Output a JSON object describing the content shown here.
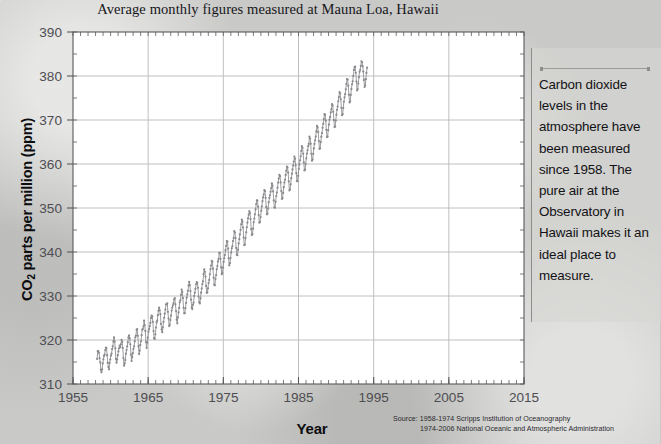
{
  "chart_data": {
    "type": "line",
    "title": "Average monthly figures measured at Mauna Loa, Hawaii",
    "xlabel": "Year",
    "ylabel_html": "CO<sub>2</sub> parts per million (ppm)",
    "ylabel_text": "CO2 parts per million (ppm)",
    "xlim": [
      1955,
      2015
    ],
    "ylim": [
      310,
      390
    ],
    "x_major_ticks": [
      1955,
      1965,
      1975,
      1985,
      1995,
      2005,
      2015
    ],
    "x_minor_step": 1,
    "y_major_ticks": [
      310,
      320,
      330,
      340,
      350,
      360,
      370,
      380,
      390
    ],
    "y_minor_step": 5,
    "grid": "major-both",
    "legend": "none",
    "marker": "circle",
    "series_name": "Monthly mean CO2 concentration",
    "series_color": "#8a8a8e",
    "x_start": 1958.208,
    "x_step": 0.08333,
    "values": [
      315.71,
      317.45,
      317.5,
      317.1,
      315.86,
      314.93,
      313.2,
      312.66,
      313.33,
      314.67,
      315.62,
      316.38,
      316.71,
      317.72,
      318.29,
      318.16,
      316.55,
      314.8,
      313.84,
      313.34,
      314.81,
      315.59,
      316.43,
      316.9,
      317.94,
      318.56,
      319.69,
      320.58,
      319.61,
      318.1,
      315.71,
      314.85,
      315.56,
      316.55,
      317.4,
      318.13,
      318.74,
      318.38,
      319.02,
      320.03,
      319.59,
      318.18,
      315.91,
      314.16,
      314.67,
      315.43,
      316.89,
      317.7,
      318.54,
      319.48,
      320.58,
      321.03,
      320.35,
      319.03,
      316.69,
      315.23,
      316.1,
      317.01,
      317.94,
      318.56,
      319.68,
      320.63,
      321.01,
      322.33,
      322.5,
      320.97,
      318.6,
      316.79,
      317.6,
      318.89,
      319.7,
      321.09,
      322.33,
      322.5,
      323.04,
      324.42,
      323.41,
      322.06,
      319.55,
      318.18,
      319.4,
      320.54,
      321.86,
      322.47,
      323.15,
      323.89,
      325.02,
      325.57,
      325.36,
      324.14,
      322.03,
      320.41,
      320.25,
      321.31,
      322.84,
      324.0,
      324.42,
      325.64,
      326.66,
      327.34,
      326.76,
      325.88,
      323.67,
      322.38,
      321.78,
      322.85,
      324.11,
      325.06,
      325.98,
      326.93,
      328.13,
      328.07,
      328.34,
      326.41,
      324.87,
      323.17,
      323.46,
      324.53,
      325.54,
      326.71,
      327.38,
      327.87,
      328.4,
      329.23,
      329.5,
      328.11,
      326.59,
      324.61,
      323.78,
      325.13,
      326.26,
      327.3,
      328.57,
      329.05,
      330.27,
      331.45,
      330.91,
      329.52,
      327.33,
      326.06,
      326.12,
      327.19,
      328.43,
      329.61,
      330.37,
      331.18,
      332.37,
      333.21,
      332.45,
      331.14,
      329.17,
      327.35,
      327.02,
      327.99,
      328.48,
      330.01,
      330.77,
      331.6,
      332.67,
      333.17,
      332.96,
      331.88,
      329.89,
      328.59,
      328.32,
      329.44,
      330.76,
      331.71,
      332.7,
      333.31,
      334.97,
      336.04,
      335.47,
      334.43,
      332.28,
      330.72,
      330.84,
      331.73,
      332.96,
      333.66,
      334.94,
      336.12,
      336.92,
      337.98,
      337.78,
      336.2,
      334.19,
      332.57,
      332.43,
      333.86,
      334.76,
      336.08,
      336.79,
      337.85,
      338.43,
      339.8,
      339.83,
      338.47,
      336.5,
      334.92,
      335.2,
      336.48,
      337.75,
      338.58,
      339.32,
      340.42,
      341.39,
      342.49,
      342.34,
      340.8,
      338.54,
      336.98,
      337.47,
      338.62,
      339.86,
      340.85,
      341.35,
      342.48,
      343.17,
      344.74,
      344.42,
      343.18,
      340.92,
      339.4,
      339.26,
      340.52,
      341.94,
      342.91,
      343.99,
      345.04,
      346.31,
      347.38,
      346.9,
      345.57,
      343.28,
      341.54,
      341.71,
      343.12,
      344.47,
      345.62,
      346.66,
      347.65,
      348.48,
      349.31,
      348.89,
      347.5,
      345.21,
      343.84,
      344.07,
      345.3,
      346.76,
      347.61,
      348.56,
      349.69,
      350.9,
      351.74,
      351.7,
      350.31,
      348.4,
      346.67,
      346.85,
      347.94,
      349.4,
      350.39,
      351.54,
      352.4,
      353.05,
      354.09,
      353.83,
      352.32,
      350.25,
      348.56,
      348.73,
      349.89,
      351.33,
      352.31,
      352.9,
      353.71,
      354.53,
      355.58,
      355.07,
      353.79,
      351.73,
      350.15,
      350.08,
      351.41,
      352.73,
      353.51,
      354.61,
      355.78,
      356.7,
      357.54,
      357.23,
      355.81,
      353.86,
      352.05,
      352.26,
      353.42,
      354.74,
      355.77,
      356.42,
      357.52,
      358.51,
      359.42,
      359.2,
      358.06,
      356.06,
      354.0,
      354.26,
      355.38,
      356.78,
      357.8,
      358.76,
      359.65,
      360.57,
      361.7,
      361.2,
      359.7,
      357.92,
      356.08,
      356.12,
      357.32,
      358.9,
      359.9,
      360.85,
      361.75,
      362.98,
      364.06,
      363.69,
      362.33,
      360.35,
      358.55,
      358.7,
      360.0,
      361.29,
      362.37,
      363.13,
      364.04,
      364.57,
      366.2,
      365.79,
      364.63,
      362.33,
      360.74,
      361.01,
      362.31,
      363.55,
      364.57,
      365.39,
      366.22,
      367.41,
      368.67,
      368.31,
      367.28,
      365.2,
      363.45,
      363.56,
      364.96,
      366.22,
      367.02,
      368.22,
      369.14,
      370.21,
      371.33,
      371.15,
      369.85,
      367.77,
      366.12,
      366.24,
      367.69,
      368.94,
      370.07,
      370.7,
      371.74,
      372.43,
      373.64,
      373.32,
      371.85,
      369.99,
      368.41,
      368.51,
      369.86,
      371.2,
      372.31,
      373.05,
      374.26,
      375.21,
      376.35,
      376.08,
      374.7,
      372.77,
      371.08,
      371.33,
      372.71,
      374.15,
      375.15,
      375.86,
      376.98,
      378.21,
      379.31,
      379.19,
      377.77,
      375.76,
      374.0,
      374.24,
      375.69,
      377.06,
      378.13,
      378.78,
      380.02,
      381.37,
      382.02,
      382.15,
      380.74,
      378.74,
      376.7,
      377.02,
      378.3,
      379.74,
      380.97,
      381.42,
      382.31,
      383.34,
      383.1,
      382.2,
      381.0,
      379.1,
      377.5,
      377.9,
      379.3,
      380.7,
      381.9
    ]
  },
  "caption": {
    "text": "Carbon dioxide levels in the atmosphere have been measured since 1958. The pure air at the Observatory in Hawaii makes it an ideal place to measure."
  },
  "source": {
    "line1": "Source: 1958-1974 Scripps Institution of Oceanography",
    "line2": "1974-2006 National Oceanic and Atmospheric Administration"
  },
  "colors": {
    "background": "#c9c9c7",
    "plot_background": "#ffffff",
    "grid": "#b9b9bb",
    "axis": "#5a5a5e",
    "series": "#8a8a8e",
    "text": "#16161a"
  }
}
